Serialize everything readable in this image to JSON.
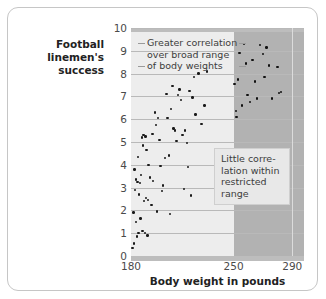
{
  "chart_data": {
    "type": "scatter",
    "title": "",
    "xlabel": "Body weight in pounds",
    "ylabel": "Football linemen's success",
    "xlim": [
      180,
      298
    ],
    "ylim": [
      0,
      10
    ],
    "xticks": [
      180,
      250,
      290
    ],
    "xticklabels": [
      "180",
      "250",
      "290"
    ],
    "yticks": [
      0,
      1,
      2,
      3,
      4,
      5,
      6,
      7,
      8,
      9,
      10
    ],
    "yticklabels": [
      "0",
      "1",
      "2",
      "3",
      "4",
      "5",
      "6",
      "7",
      "8",
      "9",
      "10"
    ],
    "grid": "horizontal",
    "legend": "none",
    "annotations": [
      {
        "name": "broad-range-note",
        "text": "Greater correlation over broad range of body weights",
        "lines": [
          "Greater correlation",
          "over broad range",
          "of body weights"
        ],
        "region": "light"
      },
      {
        "name": "restricted-range-note",
        "text": "Little correlation within restricted range",
        "lines": [
          "Little corre-",
          "lation within",
          "restricted",
          "range"
        ],
        "region": "dark"
      }
    ],
    "regions": [
      {
        "name": "broad-range-band",
        "label": "broad range",
        "x_start": 180,
        "x_end": 250,
        "color": "#ededed"
      },
      {
        "name": "restricted-range-band",
        "label": "restricted range",
        "x_start": 250,
        "x_end": 298,
        "color": "#b2b2b2"
      }
    ],
    "series": [
      {
        "name": "Broad range linemen",
        "region": "broad-range-band",
        "points": [
          [
            181.0,
            0.35
          ],
          [
            181.6,
            1.9
          ],
          [
            182.0,
            0.55
          ],
          [
            182.4,
            3.8
          ],
          [
            182.6,
            2.9
          ],
          [
            183.2,
            1.5
          ],
          [
            183.6,
            3.35
          ],
          [
            184.0,
            0.85
          ],
          [
            184.4,
            3.25
          ],
          [
            184.6,
            4.35
          ],
          [
            185.0,
            1.0
          ],
          [
            185.4,
            2.7
          ],
          [
            186.0,
            3.2
          ],
          [
            186.4,
            1.65
          ],
          [
            186.8,
            3.55
          ],
          [
            187.4,
            5.2
          ],
          [
            187.8,
            1.1
          ],
          [
            188.2,
            4.85
          ],
          [
            188.6,
            5.3
          ],
          [
            189.0,
            2.4
          ],
          [
            189.4,
            1.0
          ],
          [
            189.8,
            5.25
          ],
          [
            190.2,
            2.55
          ],
          [
            190.6,
            4.65
          ],
          [
            191.2,
            0.9
          ],
          [
            191.6,
            2.45
          ],
          [
            192.0,
            4.0
          ],
          [
            193.0,
            3.45
          ],
          [
            194.0,
            2.25
          ],
          [
            194.6,
            5.35
          ],
          [
            195.2,
            3.3
          ],
          [
            196.4,
            6.3
          ],
          [
            197.0,
            5.75
          ],
          [
            197.8,
            1.95
          ],
          [
            198.6,
            6.05
          ],
          [
            199.4,
            5.1
          ],
          [
            200.2,
            3.95
          ],
          [
            201.0,
            2.85
          ],
          [
            202.0,
            3.1
          ],
          [
            203.0,
            4.3
          ],
          [
            204.2,
            7.1
          ],
          [
            205.0,
            6.05
          ],
          [
            206.0,
            4.4
          ],
          [
            206.6,
            1.85
          ],
          [
            207.4,
            6.45
          ],
          [
            208.2,
            7.45
          ],
          [
            209.0,
            5.6
          ],
          [
            210.0,
            5.5
          ],
          [
            211.0,
            5.05
          ],
          [
            212.0,
            7.05
          ],
          [
            213.0,
            7.3
          ],
          [
            214.0,
            6.85
          ],
          [
            215.0,
            5.3
          ],
          [
            216.0,
            2.95
          ],
          [
            217.0,
            5.5
          ],
          [
            218.0,
            4.95
          ],
          [
            219.0,
            3.9
          ],
          [
            220.0,
            7.25
          ],
          [
            221.0,
            2.65
          ],
          [
            222.0,
            6.95
          ],
          [
            223.0,
            7.85
          ],
          [
            224.0,
            6.2
          ],
          [
            226.0,
            8.0
          ],
          [
            228.0,
            5.8
          ],
          [
            230.0,
            6.6
          ],
          [
            232.0,
            8.1
          ]
        ]
      },
      {
        "name": "Restricted range linemen",
        "region": "restricted-range-band",
        "points": [
          [
            250.5,
            7.55
          ],
          [
            251.5,
            6.35
          ],
          [
            252.0,
            6.1
          ],
          [
            253.0,
            7.75
          ],
          [
            254.0,
            8.9
          ],
          [
            255.5,
            6.6
          ],
          [
            257.0,
            9.3
          ],
          [
            258.5,
            8.45
          ],
          [
            259.5,
            7.05
          ],
          [
            261.0,
            6.75
          ],
          [
            263.0,
            8.6
          ],
          [
            264.5,
            7.65
          ],
          [
            266.0,
            6.9
          ],
          [
            268.0,
            9.25
          ],
          [
            270.0,
            8.85
          ],
          [
            271.0,
            7.85
          ],
          [
            272.5,
            9.15
          ],
          [
            274.0,
            8.35
          ],
          [
            276.0,
            6.9
          ],
          [
            280.0,
            8.3
          ],
          [
            281.0,
            7.15
          ],
          [
            282.5,
            7.2
          ]
        ]
      }
    ]
  },
  "axis": {
    "x_label": "Body weight in pounds",
    "y_label_lines": [
      "Football linemen's",
      "success"
    ],
    "x_tick_labels": [
      "180",
      "250",
      "290"
    ],
    "y_tick_labels": [
      "10",
      "9",
      "8",
      "7",
      "6",
      "5",
      "4",
      "3",
      "2",
      "1",
      "0"
    ]
  },
  "annotations": {
    "broad": {
      "line1": "Greater correlation",
      "line2": "over broad range",
      "line3": "of body weights"
    },
    "restricted": {
      "line1": "Little corre-",
      "line2": "lation within",
      "line3": "restricted",
      "line4": "range"
    }
  },
  "colors": {
    "light_band": "#ededed",
    "dark_band": "#b2b2b2",
    "gridline": "#b9b9b9",
    "point": "#1a1a1a",
    "frame": "#c6c6c6",
    "text": "#222222"
  }
}
